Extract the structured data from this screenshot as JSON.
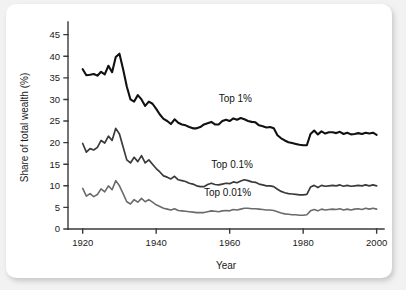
{
  "figure": {
    "background_color": "#f2f2f2",
    "card_color": "#ffffff"
  },
  "chart_data": {
    "type": "line",
    "title": "",
    "xlabel": "Year",
    "ylabel": "Share of total wealth (%)",
    "xlim": [
      1916,
      2002
    ],
    "ylim": [
      0,
      47
    ],
    "xticks": [
      1920,
      1940,
      1960,
      1980,
      2000
    ],
    "xtick_labels": [
      "1920",
      "1940",
      "1960",
      "1980",
      "2000"
    ],
    "yticks": [
      0,
      5,
      10,
      15,
      20,
      25,
      30,
      35,
      40,
      45
    ],
    "ytick_labels": [
      "0",
      "5",
      "10",
      "15",
      "20",
      "25",
      "30",
      "35",
      "40",
      "45"
    ],
    "grid": false,
    "legend_position": "inline-annotations",
    "annotations": [
      {
        "text": "Top 1%",
        "x": 1957,
        "y": 29.5
      },
      {
        "text": "Top 0.1%",
        "x": 1955,
        "y": 14.2
      },
      {
        "text": "Top 0.01%",
        "x": 1953,
        "y": 7.6
      }
    ],
    "series": [
      {
        "name": "Top 1%",
        "color": "#111111",
        "width": 2.1,
        "x": [
          1920,
          1921,
          1922,
          1923,
          1924,
          1925,
          1926,
          1927,
          1928,
          1929,
          1930,
          1931,
          1932,
          1933,
          1934,
          1935,
          1936,
          1937,
          1938,
          1939,
          1940,
          1941,
          1942,
          1943,
          1944,
          1945,
          1946,
          1947,
          1948,
          1949,
          1950,
          1951,
          1952,
          1953,
          1954,
          1955,
          1956,
          1957,
          1958,
          1959,
          1960,
          1961,
          1962,
          1963,
          1964,
          1965,
          1966,
          1967,
          1968,
          1969,
          1970,
          1971,
          1972,
          1973,
          1974,
          1975,
          1976,
          1977,
          1978,
          1979,
          1980,
          1981,
          1982,
          1983,
          1984,
          1985,
          1986,
          1987,
          1988,
          1989,
          1990,
          1991,
          1992,
          1993,
          1994,
          1995,
          1996,
          1997,
          1998,
          1999,
          2000
        ],
        "values": [
          37.0,
          35.6,
          35.7,
          35.9,
          35.5,
          36.4,
          35.8,
          37.8,
          36.3,
          39.8,
          40.6,
          37.0,
          33.0,
          30.0,
          29.5,
          31.0,
          30.0,
          28.5,
          29.5,
          29.0,
          27.8,
          26.5,
          25.5,
          25.0,
          24.3,
          25.4,
          24.6,
          24.2,
          24.0,
          23.6,
          23.3,
          23.3,
          23.6,
          24.2,
          24.5,
          24.8,
          24.2,
          24.2,
          25.0,
          25.3,
          25.0,
          25.6,
          25.3,
          25.7,
          25.4,
          25.0,
          24.8,
          24.7,
          24.0,
          23.8,
          23.5,
          23.6,
          23.3,
          21.7,
          21.0,
          20.5,
          20.1,
          19.9,
          19.7,
          19.5,
          19.4,
          19.4,
          22.0,
          22.8,
          21.9,
          22.6,
          22.1,
          22.4,
          22.4,
          22.2,
          22.5,
          22.0,
          22.3,
          21.9,
          22.0,
          22.2,
          22.0,
          22.3,
          22.1,
          22.3,
          21.8
        ]
      },
      {
        "name": "Top 0.1%",
        "color": "#3a3a3a",
        "width": 1.7,
        "x": [
          1920,
          1921,
          1922,
          1923,
          1924,
          1925,
          1926,
          1927,
          1928,
          1929,
          1930,
          1931,
          1932,
          1933,
          1934,
          1935,
          1936,
          1937,
          1938,
          1939,
          1940,
          1941,
          1942,
          1943,
          1944,
          1945,
          1946,
          1947,
          1948,
          1949,
          1950,
          1951,
          1952,
          1953,
          1954,
          1955,
          1956,
          1957,
          1958,
          1959,
          1960,
          1961,
          1962,
          1963,
          1964,
          1965,
          1966,
          1967,
          1968,
          1969,
          1970,
          1971,
          1972,
          1973,
          1974,
          1975,
          1976,
          1977,
          1978,
          1979,
          1980,
          1981,
          1982,
          1983,
          1984,
          1985,
          1986,
          1987,
          1988,
          1989,
          1990,
          1991,
          1992,
          1993,
          1994,
          1995,
          1996,
          1997,
          1998,
          1999,
          2000
        ],
        "values": [
          19.8,
          17.8,
          18.6,
          18.3,
          18.9,
          20.5,
          19.9,
          21.5,
          20.5,
          23.3,
          22.0,
          19.0,
          16.0,
          15.3,
          16.6,
          15.6,
          17.0,
          15.3,
          16.0,
          15.0,
          14.0,
          13.2,
          12.3,
          12.0,
          11.6,
          12.2,
          11.4,
          11.2,
          11.0,
          10.6,
          10.4,
          10.0,
          9.8,
          9.8,
          10.3,
          10.6,
          10.3,
          10.2,
          10.4,
          10.6,
          10.5,
          10.9,
          10.7,
          11.1,
          11.4,
          11.2,
          10.9,
          10.8,
          10.4,
          10.2,
          10.0,
          10.0,
          9.8,
          9.2,
          8.7,
          8.4,
          8.2,
          8.1,
          8.0,
          7.9,
          7.9,
          8.0,
          9.7,
          10.1,
          9.6,
          10.1,
          9.9,
          10.0,
          10.1,
          10.0,
          10.2,
          9.9,
          10.1,
          9.9,
          10.0,
          10.1,
          10.0,
          10.2,
          10.0,
          10.2,
          10.0
        ]
      },
      {
        "name": "Top 0.01%",
        "color": "#6b6b6b",
        "width": 1.6,
        "x": [
          1920,
          1921,
          1922,
          1923,
          1924,
          1925,
          1926,
          1927,
          1928,
          1929,
          1930,
          1931,
          1932,
          1933,
          1934,
          1935,
          1936,
          1937,
          1938,
          1939,
          1940,
          1941,
          1942,
          1943,
          1944,
          1945,
          1946,
          1947,
          1948,
          1949,
          1950,
          1951,
          1952,
          1953,
          1954,
          1955,
          1956,
          1957,
          1958,
          1959,
          1960,
          1961,
          1962,
          1963,
          1964,
          1965,
          1966,
          1967,
          1968,
          1969,
          1970,
          1971,
          1972,
          1973,
          1974,
          1975,
          1976,
          1977,
          1978,
          1979,
          1980,
          1981,
          1982,
          1983,
          1984,
          1985,
          1986,
          1987,
          1988,
          1989,
          1990,
          1991,
          1992,
          1993,
          1994,
          1995,
          1996,
          1997,
          1998,
          1999,
          2000
        ],
        "values": [
          9.4,
          7.6,
          8.2,
          7.5,
          8.0,
          9.3,
          8.6,
          10.0,
          9.1,
          11.2,
          10.0,
          8.2,
          6.3,
          5.8,
          6.8,
          6.2,
          7.1,
          6.3,
          6.8,
          6.2,
          5.6,
          5.2,
          4.8,
          4.6,
          4.4,
          4.7,
          4.3,
          4.2,
          4.1,
          4.0,
          3.9,
          3.8,
          3.8,
          3.8,
          4.0,
          4.2,
          4.1,
          4.0,
          4.2,
          4.3,
          4.2,
          4.5,
          4.4,
          4.6,
          4.8,
          4.8,
          4.7,
          4.7,
          4.6,
          4.5,
          4.4,
          4.4,
          4.3,
          4.0,
          3.7,
          3.5,
          3.4,
          3.3,
          3.3,
          3.2,
          3.2,
          3.3,
          4.2,
          4.5,
          4.2,
          4.6,
          4.4,
          4.5,
          4.6,
          4.5,
          4.7,
          4.4,
          4.6,
          4.4,
          4.6,
          4.7,
          4.5,
          4.8,
          4.6,
          4.8,
          4.6
        ]
      }
    ]
  }
}
